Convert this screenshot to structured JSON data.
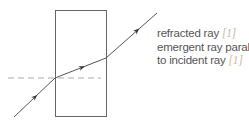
{
  "diagram": {
    "block": {
      "x": 55,
      "y": 10,
      "width": 51,
      "height": 106
    },
    "normal": {
      "x1": 8,
      "y1": 78,
      "x2": 101,
      "y2": 78
    },
    "rays": {
      "incident": {
        "x1": 14,
        "y1": 117,
        "x2": 55,
        "y2": 78
      },
      "refracted": {
        "x1": 55,
        "y1": 78,
        "x2": 106,
        "y2": 58
      },
      "emergent": {
        "x1": 106,
        "y1": 58,
        "x2": 157,
        "y2": 13
      }
    },
    "colors": {
      "line": "#555555",
      "dash": "#aaaaaa",
      "text": "#555555",
      "mark": "#c9b8a0"
    }
  },
  "labels": [
    {
      "text": "refracted ray ",
      "mark": "[1]"
    },
    {
      "text": "emergent ray parallel",
      "mark": ""
    },
    {
      "text": "to incident ray ",
      "mark": "[1]"
    }
  ]
}
